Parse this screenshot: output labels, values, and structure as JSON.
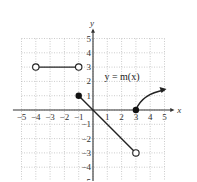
{
  "chart_data": {
    "type": "line",
    "title": "",
    "function_label": "y = m(x)",
    "xlabel": "x",
    "ylabel": "y",
    "xlim": [
      -5,
      5
    ],
    "ylim": [
      -5,
      5
    ],
    "grid": true,
    "x_tick_labels": [
      "-5",
      "-4",
      "-3",
      "-2",
      "-1",
      "1",
      "2",
      "3",
      "4",
      "5"
    ],
    "y_tick_labels": [
      "5",
      "4",
      "3",
      "2",
      "1",
      "-1",
      "-2",
      "-3",
      "-4",
      "-5"
    ],
    "pieces": [
      {
        "type": "segment",
        "from": [
          -4,
          3
        ],
        "to": [
          -1,
          3
        ],
        "from_endpoint": "open",
        "to_endpoint": "open"
      },
      {
        "type": "segment",
        "from": [
          -1,
          1
        ],
        "to": [
          3,
          -3
        ],
        "from_endpoint": "closed",
        "to_endpoint": "open"
      },
      {
        "type": "curve",
        "from": [
          3,
          0
        ],
        "to": [
          5,
          1.4
        ],
        "from_endpoint": "closed",
        "to_endpoint": "arrow"
      }
    ]
  }
}
